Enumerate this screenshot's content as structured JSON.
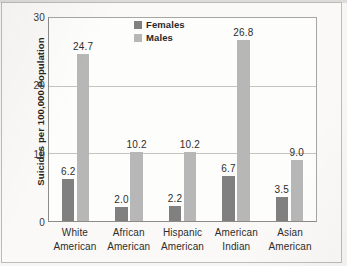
{
  "chart_data": {
    "type": "bar",
    "title": "",
    "xlabel": "",
    "ylabel": "Suicides per 100,000 Population",
    "ylim": [
      0,
      30
    ],
    "yticks": [
      "0",
      "10",
      "20",
      "30"
    ],
    "grid": "horizontal",
    "legend_position": "top-center",
    "categories": [
      "White American",
      "African American",
      "Hispanic American",
      "American Indian",
      "Asian American"
    ],
    "categories_lines": [
      [
        "White",
        "American"
      ],
      [
        "African",
        "American"
      ],
      [
        "Hispanic",
        "American"
      ],
      [
        "American",
        "Indian"
      ],
      [
        "Asian",
        "American"
      ]
    ],
    "series": [
      {
        "name": "Females",
        "color": "#808080",
        "values": [
          6.2,
          2.0,
          2.2,
          6.7,
          3.5
        ],
        "labels": [
          "6.2",
          "2.0",
          "2.2",
          "6.7",
          "3.5"
        ]
      },
      {
        "name": "Males",
        "color": "#b7b7b7",
        "values": [
          24.7,
          10.2,
          10.2,
          26.8,
          9.0
        ],
        "labels": [
          "24.7",
          "10.2",
          "10.2",
          "26.8",
          "9.0"
        ]
      }
    ]
  },
  "legend": {
    "items": [
      {
        "label": "Females",
        "color": "#808080"
      },
      {
        "label": "Males",
        "color": "#b7b7b7"
      }
    ]
  },
  "axis": {
    "y_title": "Suicides per 100,000 Population",
    "y_ticks": [
      "30",
      "20",
      "10",
      "0"
    ]
  },
  "colors": {
    "female_bar": "#808080",
    "male_bar": "#b7b7b7",
    "gridline": "#c5c3c0",
    "axis": "#8d8b88",
    "plot_background": "#fdfdfc",
    "page_background": "#faf9f7"
  }
}
